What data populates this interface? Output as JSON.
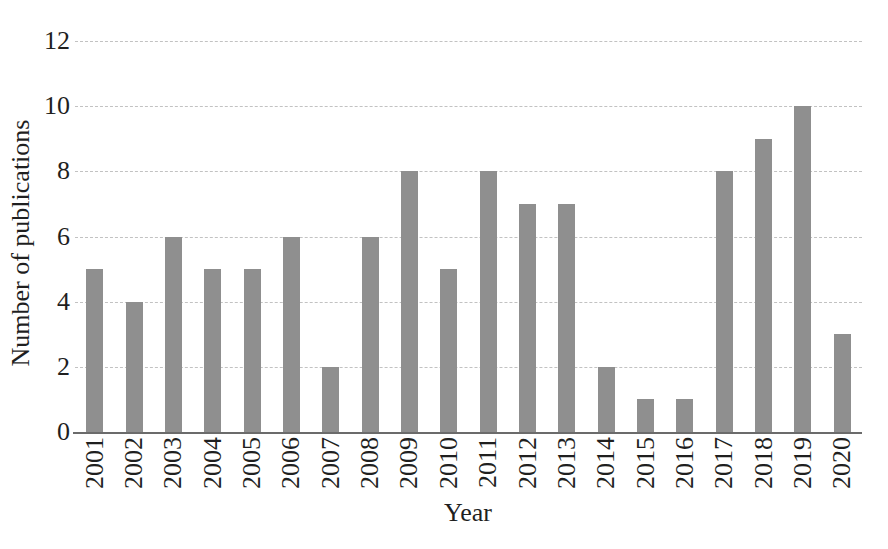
{
  "chart_data": {
    "type": "bar",
    "title": "",
    "xlabel": "Year",
    "ylabel": "Number of publications",
    "categories": [
      "2001",
      "2002",
      "2003",
      "2004",
      "2005",
      "2006",
      "2007",
      "2008",
      "2009",
      "2010",
      "2011",
      "2012",
      "2013",
      "2014",
      "2015",
      "2016",
      "2017",
      "2018",
      "2019",
      "2020"
    ],
    "values": [
      5,
      4,
      6,
      5,
      5,
      6,
      2,
      6,
      8,
      5,
      8,
      7,
      7,
      2,
      1,
      1,
      8,
      9,
      10,
      3
    ],
    "yticks": [
      0,
      2,
      4,
      6,
      8,
      10,
      12
    ],
    "ylim": [
      0,
      12
    ],
    "grid": "horizontal-dashed",
    "legend": "none",
    "bar_color": "#8f8f8f",
    "gridline_color": "#c2c2c2",
    "axis_color": "#6b6b6b",
    "text_color": "#1f1f1f"
  }
}
